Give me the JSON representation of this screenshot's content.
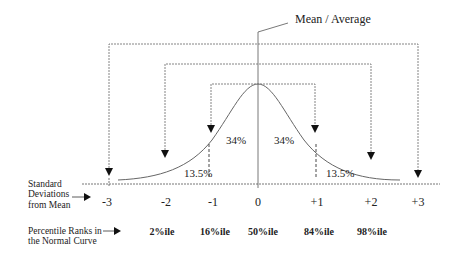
{
  "title": "Mean / Average",
  "area_labels": {
    "left_inner": "34%",
    "right_inner": "34%",
    "left_outer": "13.5%",
    "right_outer": "13.5%"
  },
  "sd_axis": {
    "label_line1": "Standard",
    "label_line2": "Deviations",
    "label_line3": "from Mean",
    "ticks": [
      "-3",
      "-2",
      "-1",
      "0",
      "+1",
      "+2",
      "+3"
    ]
  },
  "percentile_axis": {
    "label_line1": "Percentile Ranks in",
    "label_line2": "the Normal Curve",
    "ticks": [
      "2%ile",
      "16%ile",
      "50%ile",
      "84%ile",
      "98%ile"
    ]
  },
  "colors": {
    "line": "#555555",
    "text": "#222222",
    "arrow": "#111111"
  }
}
